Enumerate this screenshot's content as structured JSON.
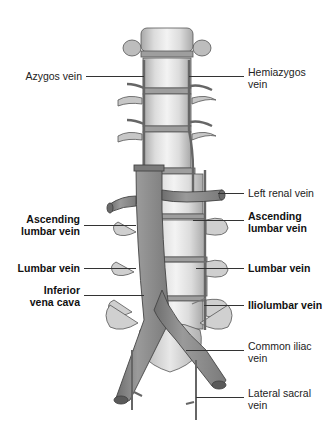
{
  "figure": {
    "colors": {
      "background": "#ffffff",
      "vertebra_body": "#d9d9d9",
      "vertebra_highlight": "#f2f2f2",
      "vertebra_shadow": "#9a9a9a",
      "vein_fill": "#8c8c8c",
      "vein_dark": "#5e5e5e",
      "outline": "#3a3a3a",
      "label_text": "#222222"
    }
  },
  "labels": {
    "left": [
      {
        "id": "azygos",
        "lines": [
          "Azygos vein"
        ],
        "bold": false
      },
      {
        "id": "asc-lumbar-left",
        "lines": [
          "Ascending",
          "lumbar vein"
        ],
        "bold": true
      },
      {
        "id": "lumbar-left",
        "lines": [
          "Lumbar vein"
        ],
        "bold": true
      },
      {
        "id": "ivc",
        "lines": [
          "Inferior",
          "vena cava"
        ],
        "bold": true
      }
    ],
    "right": [
      {
        "id": "hemiazygos",
        "lines": [
          "Hemiazygos",
          "vein"
        ],
        "bold": false
      },
      {
        "id": "left-renal",
        "lines": [
          "Left renal vein"
        ],
        "bold": false
      },
      {
        "id": "asc-lumbar-right",
        "lines": [
          "Ascending",
          "lumbar vein"
        ],
        "bold": true
      },
      {
        "id": "lumbar-right",
        "lines": [
          "Lumbar vein"
        ],
        "bold": true
      },
      {
        "id": "iliolumbar",
        "lines": [
          "Iliolumbar vein"
        ],
        "bold": true
      },
      {
        "id": "common-iliac",
        "lines": [
          "Common iliac",
          "vein"
        ],
        "bold": false
      },
      {
        "id": "lateral-sacral",
        "lines": [
          "Lateral sacral",
          "vein"
        ],
        "bold": false
      }
    ]
  }
}
